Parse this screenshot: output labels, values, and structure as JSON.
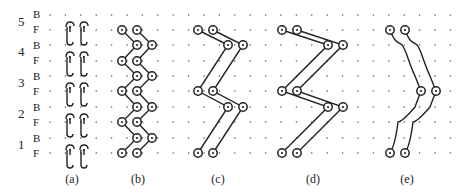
{
  "diagram": {
    "courses": [
      {
        "number": "5",
        "back_label": "B",
        "front_label": "F",
        "y_back": 15,
        "y_front": 30
      },
      {
        "number": "4",
        "back_label": "B",
        "front_label": "F",
        "y_back": 45,
        "y_front": 61
      },
      {
        "number": "3",
        "back_label": "B",
        "front_label": "F",
        "y_back": 76,
        "y_front": 91
      },
      {
        "number": "2",
        "back_label": "B",
        "front_label": "F",
        "y_back": 107,
        "y_front": 122
      },
      {
        "number": "1",
        "back_label": "B",
        "front_label": "F",
        "y_back": 138,
        "y_front": 153
      }
    ],
    "grid": {
      "x_start": 50,
      "x_end": 455,
      "dx": 15.4,
      "dot_color": "#555555"
    },
    "line_color": "#222222",
    "panels": [
      {
        "id": "a",
        "caption": "(a)",
        "caption_x": 72
      },
      {
        "id": "b",
        "caption": "(b)",
        "caption_x": 138
      },
      {
        "id": "c",
        "caption": "(c)",
        "caption_x": 218
      },
      {
        "id": "d",
        "caption": "(d)",
        "caption_x": 313
      },
      {
        "id": "e",
        "caption": "(e)",
        "caption_x": 407
      }
    ]
  }
}
